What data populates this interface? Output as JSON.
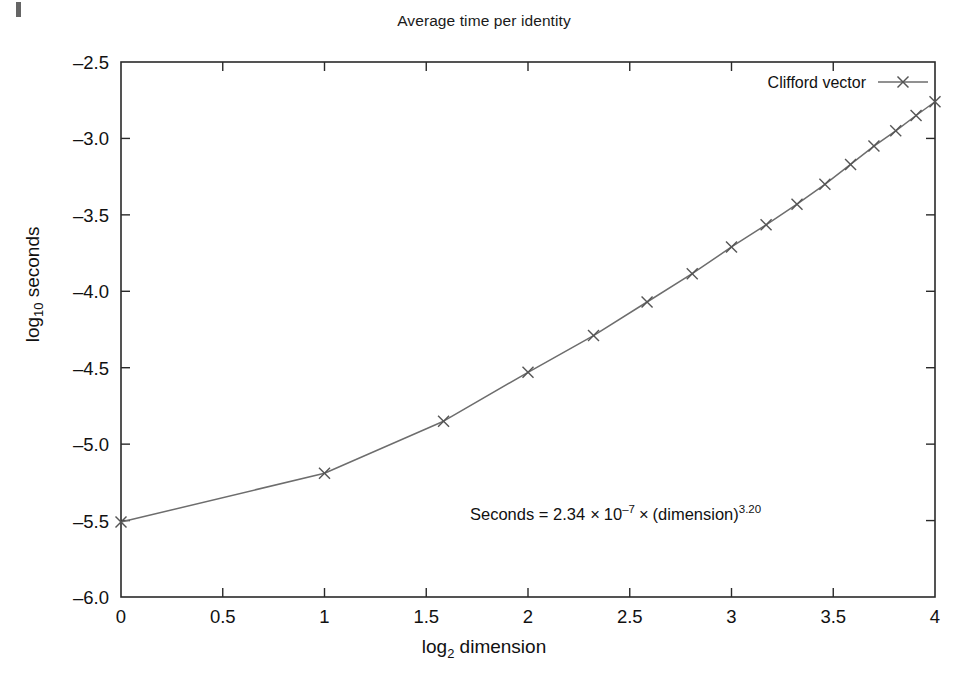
{
  "chart_data": {
    "type": "line",
    "title": "Average time per identity",
    "xlabel_main": "log",
    "xlabel_sub": "2",
    "xlabel_tail": " dimension",
    "ylabel_main": "log",
    "ylabel_sub": "10",
    "ylabel_tail": " seconds",
    "xlim": [
      0,
      4
    ],
    "ylim": [
      -6.0,
      -2.5
    ],
    "xticks": [
      0,
      0.5,
      1,
      1.5,
      2,
      2.5,
      3,
      3.5,
      4
    ],
    "xtick_labels": [
      "0",
      "0.5",
      "1",
      "1.5",
      "2",
      "2.5",
      "3",
      "3.5",
      "4"
    ],
    "yticks": [
      -6.0,
      -5.5,
      -5.0,
      -4.5,
      -4.0,
      -3.5,
      -3.0,
      -2.5
    ],
    "ytick_labels": [
      "–6.0",
      "–5.5",
      "–5.0",
      "–4.5",
      "–4.0",
      "–3.5",
      "–3.0",
      "–2.5"
    ],
    "grid": false,
    "legend_position": "top-right-inside",
    "series": [
      {
        "name": "Clifford vector",
        "marker": "x",
        "color": "#6d6d6d",
        "x": [
          0.0,
          1.0,
          1.585,
          2.0,
          2.322,
          2.585,
          2.807,
          3.0,
          3.17,
          3.322,
          3.459,
          3.585,
          3.7,
          3.807,
          3.907,
          4.0
        ],
        "y": [
          -5.51,
          -5.19,
          -4.85,
          -4.53,
          -4.29,
          -4.07,
          -3.885,
          -3.71,
          -3.565,
          -3.43,
          -3.3,
          -3.17,
          -3.05,
          -2.95,
          -2.85,
          -2.76
        ],
        "dimensions": [
          1,
          2,
          3,
          4,
          5,
          6,
          7,
          8,
          9,
          10,
          11,
          12,
          13,
          14,
          15,
          16
        ]
      }
    ],
    "annotation": {
      "prefix": "Seconds = 2.34",
      "times1": "×",
      "base": "10",
      "exp1": "–7",
      "times2": "×",
      "paren": "(dimension)",
      "exp2": "3.20",
      "full_text": "Seconds = 2.34×10−7×(dimension)3.20"
    }
  },
  "legend": {
    "entries": [
      {
        "label": "Clifford vector",
        "marker": "x-marker",
        "color": "#6d6d6d"
      }
    ]
  },
  "colors": {
    "axis": "#2a2a2a",
    "line": "#6d6d6d",
    "text": "#111111",
    "background": "#ffffff"
  }
}
